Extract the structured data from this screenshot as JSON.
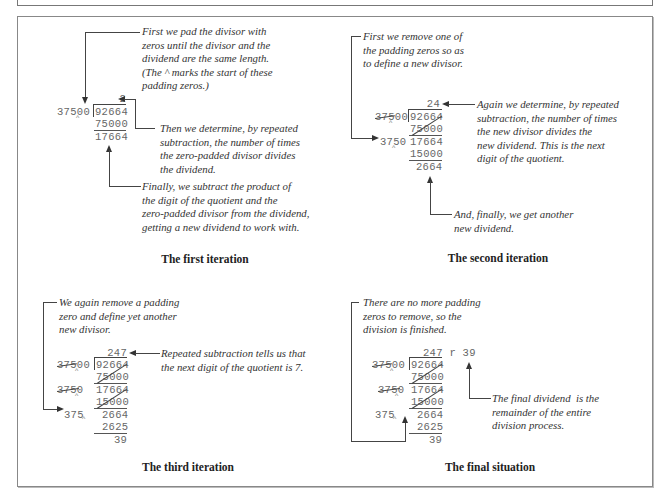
{
  "panels": {
    "first": {
      "caption": "The first iteration",
      "note_top": "First we pad the divisor with\nzeros until the divisor and the\ndividend are the same length.\n(The ^ marks the start of these\npadding zeros.)",
      "note_mid": "Then we determine, by repeated\nsubtraction, the number of times\nthe zero-padded divisor divides\nthe dividend.",
      "note_bottom": "Finally, we subtract the product of\nthe digit of the quotient and the\nzero-padded divisor from the dividend,\ngetting a new dividend to work with.",
      "quotient": "2",
      "divisor": "37500",
      "dividend": "92664",
      "product": "75000",
      "new_dividend": "17664"
    },
    "second": {
      "caption": "The second iteration",
      "note_top": "First we remove one of\nthe padding zeros so as\nto define a new divisor.",
      "note_mid": "Again we determine, by repeated\nsubtraction, the number of times\nthe new divisor divides the\nnew dividend. This is the next\ndigit of the quotient.",
      "note_bottom": "And, finally, we get another\nnew dividend.",
      "quotient": "24",
      "old_divisor": "37500",
      "dividend": "92664",
      "product1": "75000",
      "divisor": "3750",
      "dividend2": "17664",
      "product2": "15000",
      "new_dividend": "2664"
    },
    "third": {
      "caption": "The third iteration",
      "note_top": "We again remove a padding\nzero and define yet another\nnew divisor.",
      "note_mid": "Repeated subtraction tells us that\nthe next digit of the quotient is 7.",
      "quotient": "247",
      "old_divisor1": "37500",
      "dividend": "92664",
      "product1": "75000",
      "old_divisor2": "3750",
      "dividend2": "17664",
      "product2": "15000",
      "divisor": "375",
      "dividend3": "2664",
      "product3": "2625",
      "new_dividend": "39"
    },
    "final": {
      "caption": "The final situation",
      "note_top": "There are no more padding\nzeros to remove, so the\ndivision is finished.",
      "note_mid": "The final dividend  is the\nremainder of the entire\ndivision process.",
      "quotient": "247 r 39",
      "old_divisor1": "37500",
      "dividend": "92664",
      "product1": "75000",
      "old_divisor2": "3750",
      "dividend2": "17664",
      "product2": "15000",
      "divisor": "375",
      "dividend3": "2664",
      "product3": "2625",
      "remainder": "39"
    }
  },
  "caret_symbol": "^"
}
